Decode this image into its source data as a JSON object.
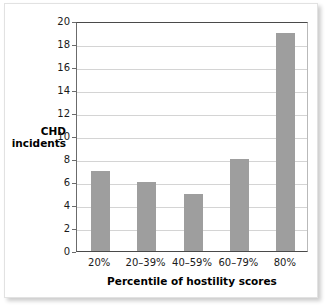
{
  "chart_data": {
    "type": "bar",
    "title": "",
    "subtitle": "",
    "xlabel": "Percentile of hostility scores",
    "ylabel": "CHD incidents",
    "ylabel_lines": [
      "CHD",
      "incidents"
    ],
    "categories": [
      "20%",
      "20–39%",
      "40–59%",
      "60–79%",
      "80%"
    ],
    "values": [
      7,
      6,
      5,
      8,
      19
    ],
    "series": [
      {
        "name": "CHD incidents",
        "values": [
          7,
          6,
          5,
          8,
          19
        ]
      }
    ],
    "ylim": [
      0,
      20
    ],
    "ytick_step": 2,
    "yticks": [
      0,
      2,
      4,
      6,
      8,
      10,
      12,
      14,
      16,
      18,
      20
    ],
    "ytick_labels": [
      "0",
      "2",
      "4",
      "6",
      "8",
      "10",
      "12",
      "14",
      "16",
      "18",
      "20"
    ],
    "grid": true,
    "grid_axis": "y",
    "legend": false,
    "legend_position": "none",
    "bar_color": "#9e9e9e",
    "gridline_color": "#d4d4d4",
    "axis_color": "#4a4a4a",
    "plot_background": "#ffffff",
    "annotations": []
  }
}
